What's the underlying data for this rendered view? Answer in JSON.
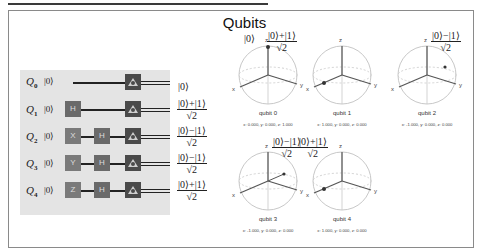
{
  "title": "Qubits",
  "circuit": {
    "qubits": [
      {
        "label": "Q",
        "index": "0",
        "init": "|0⟩",
        "gates": [],
        "output": {
          "type": "ket",
          "text": "|0⟩"
        }
      },
      {
        "label": "Q",
        "index": "1",
        "init": "|0⟩",
        "gates": [
          "H"
        ],
        "output": {
          "type": "frac",
          "num": "|0⟩+|1⟩",
          "den": "√2"
        }
      },
      {
        "label": "Q",
        "index": "2",
        "init": "|0⟩",
        "gates": [
          "X",
          "H"
        ],
        "output": {
          "type": "frac",
          "num": "|0⟩−|1⟩",
          "den": "√2"
        }
      },
      {
        "label": "Q",
        "index": "3",
        "init": "|0⟩",
        "gates": [
          "Y",
          "H"
        ],
        "output": {
          "type": "frac",
          "num": "|0⟩−|1⟩",
          "den": "√2"
        }
      },
      {
        "label": "Q",
        "index": "4",
        "init": "|0⟩",
        "gates": [
          "Z",
          "H"
        ],
        "output": {
          "type": "frac",
          "num": "|0⟩+|1⟩",
          "den": "√2"
        }
      }
    ],
    "measure_icon": "measure-icon"
  },
  "bloch_spheres": [
    {
      "name": "qubit 0",
      "coords": "x: 0.000, y: 0.000, z: 1.000",
      "state_num": "|0⟩",
      "state_den": "",
      "x": 0.0,
      "y": 0.0,
      "z": 1.0
    },
    {
      "name": "qubit 1",
      "coords": "x: 1.000, y: 0.000, z: 0.000",
      "state_num": "|0⟩+|1⟩",
      "state_den": "√2",
      "x": 1.0,
      "y": 0.0,
      "z": 0.0
    },
    {
      "name": "qubit 2",
      "coords": "x: -1.000, y: 0.000, z: 0.000",
      "state_num": "|0⟩−|1⟩",
      "state_den": "√2",
      "x": -1.0,
      "y": 0.0,
      "z": 0.0
    },
    {
      "name": "qubit 3",
      "coords": "x: -1.000, y: 0.000, z: 0.000",
      "state_num": "|0⟩−|1⟩",
      "state_den": "√2",
      "x": -1.0,
      "y": 0.0,
      "z": 0.0
    },
    {
      "name": "qubit 4",
      "coords": "x: 1.000, y: 0.000, z: 0.000",
      "state_num": "|0⟩+|1⟩",
      "state_den": "√2",
      "x": 1.0,
      "y": 0.0,
      "z": 0.0
    }
  ],
  "axis_labels": {
    "x": "x",
    "y": "y",
    "z": "z"
  }
}
